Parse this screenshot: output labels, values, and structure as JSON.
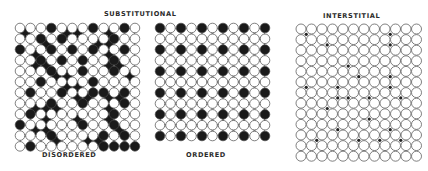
{
  "labels": {
    "substitutional": "SUBSTITUTIONAL",
    "interstitial": "INTERSTITIAL",
    "disordered": "DISORDERED",
    "ordered": "ORDERED"
  },
  "colors": {
    "background": "#ffffff",
    "atom_outline": "#4a4a4a",
    "host_atom_fill": "#ffffff",
    "solute_atom_fill": "#1a1a1a",
    "interstitial_fill": "#222222"
  },
  "panels": {
    "disordered": {
      "type": "centered-square-lattice",
      "origin_x": 20,
      "origin_y": 28,
      "col_spacing": 10.45,
      "row_step": 5.38,
      "rows": 23,
      "even_row_cols": 12,
      "odd_row_cols": 11,
      "atom_radius": 4.8,
      "solute_atoms": [
        [
          0,
          3
        ],
        [
          0,
          7
        ],
        [
          0,
          10
        ],
        [
          1,
          0
        ],
        [
          1,
          4
        ],
        [
          1,
          5
        ],
        [
          1,
          8
        ],
        [
          2,
          2
        ],
        [
          2,
          4
        ],
        [
          2,
          9
        ],
        [
          3,
          2
        ],
        [
          3,
          7
        ],
        [
          3,
          8
        ],
        [
          4,
          0
        ],
        [
          4,
          3
        ],
        [
          4,
          5
        ],
        [
          4,
          7
        ],
        [
          4,
          10
        ],
        [
          5,
          1
        ],
        [
          5,
          8
        ],
        [
          6,
          2
        ],
        [
          6,
          4
        ],
        [
          6,
          6
        ],
        [
          6,
          9
        ],
        [
          7,
          1
        ],
        [
          7,
          2
        ],
        [
          7,
          8
        ],
        [
          7,
          9
        ],
        [
          8,
          3
        ],
        [
          8,
          6
        ],
        [
          8,
          9
        ],
        [
          9,
          3
        ],
        [
          9,
          4
        ],
        [
          9,
          10
        ],
        [
          10,
          2
        ],
        [
          10,
          7
        ],
        [
          11,
          4
        ],
        [
          11,
          5
        ],
        [
          12,
          1
        ],
        [
          12,
          4
        ],
        [
          12,
          7
        ],
        [
          12,
          8
        ],
        [
          12,
          10
        ],
        [
          13,
          5
        ],
        [
          13,
          6
        ],
        [
          13,
          8
        ],
        [
          13,
          9
        ],
        [
          14,
          3
        ],
        [
          14,
          6
        ],
        [
          14,
          10
        ],
        [
          15,
          1
        ],
        [
          15,
          2
        ],
        [
          15,
          3
        ],
        [
          15,
          8
        ],
        [
          16,
          1
        ],
        [
          16,
          9
        ],
        [
          17,
          2
        ],
        [
          17,
          5
        ],
        [
          17,
          8
        ],
        [
          18,
          0
        ],
        [
          18,
          6
        ],
        [
          18,
          9
        ],
        [
          19,
          1
        ],
        [
          19,
          2
        ],
        [
          19,
          9
        ],
        [
          20,
          3
        ],
        [
          20,
          8
        ],
        [
          20,
          10
        ],
        [
          21,
          3
        ],
        [
          21,
          6
        ],
        [
          21,
          7
        ],
        [
          22,
          1
        ],
        [
          22,
          8
        ],
        [
          22,
          9
        ],
        [
          22,
          10
        ],
        [
          22,
          11
        ]
      ]
    },
    "ordered": {
      "type": "centered-square-lattice",
      "origin_x": 160,
      "origin_y": 28,
      "col_spacing": 10.5,
      "row_step": 5.4,
      "rows": 21,
      "even_row_cols": 11,
      "odd_row_cols": 10,
      "atom_radius": 4.8,
      "solute_rule": "even rows where row % 4 == 0, even column indices",
      "solute_atoms": [
        [
          0,
          0
        ],
        [
          0,
          2
        ],
        [
          0,
          4
        ],
        [
          0,
          6
        ],
        [
          0,
          8
        ],
        [
          0,
          10
        ],
        [
          4,
          0
        ],
        [
          4,
          2
        ],
        [
          4,
          4
        ],
        [
          4,
          6
        ],
        [
          4,
          8
        ],
        [
          4,
          10
        ],
        [
          8,
          0
        ],
        [
          8,
          2
        ],
        [
          8,
          4
        ],
        [
          8,
          6
        ],
        [
          8,
          8
        ],
        [
          8,
          10
        ],
        [
          12,
          0
        ],
        [
          12,
          2
        ],
        [
          12,
          4
        ],
        [
          12,
          6
        ],
        [
          12,
          8
        ],
        [
          12,
          10
        ],
        [
          16,
          0
        ],
        [
          16,
          2
        ],
        [
          16,
          4
        ],
        [
          16,
          6
        ],
        [
          16,
          8
        ],
        [
          16,
          10
        ],
        [
          20,
          0
        ],
        [
          20,
          2
        ],
        [
          20,
          4
        ],
        [
          20,
          6
        ],
        [
          20,
          8
        ],
        [
          20,
          10
        ]
      ]
    },
    "interstitial": {
      "type": "square-lattice",
      "origin_x": 301,
      "origin_y": 29,
      "col_spacing": 10.5,
      "row_spacing": 10.6,
      "cols": 12,
      "rows": 13,
      "atom_radius": 5.0,
      "interstitial_radius": 1.6,
      "interstitial_sites": [
        [
          0,
          0
        ],
        [
          1,
          2
        ],
        [
          0,
          8
        ],
        [
          1,
          8
        ],
        [
          3,
          4
        ],
        [
          4,
          5
        ],
        [
          4,
          8
        ],
        [
          5,
          0
        ],
        [
          5,
          3
        ],
        [
          5,
          8
        ],
        [
          6,
          3
        ],
        [
          6,
          4
        ],
        [
          6,
          6
        ],
        [
          6,
          9
        ],
        [
          7,
          2
        ],
        [
          8,
          6
        ],
        [
          9,
          3
        ],
        [
          9,
          8
        ],
        [
          10,
          1
        ],
        [
          10,
          5
        ],
        [
          10,
          7
        ],
        [
          10,
          9
        ]
      ]
    }
  }
}
